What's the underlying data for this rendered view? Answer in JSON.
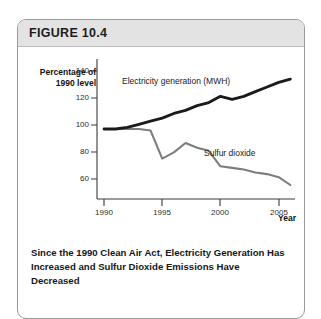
{
  "figure": {
    "header_label": "FIGURE 10.4",
    "caption": "Since the 1990 Clean Air Act, Electricity Generation Has Increased and Sulfur Dioxide Emissions Have Decreased"
  },
  "colors": {
    "electricity_line": "#1a1a1a",
    "sulfur_line": "#7d7d7d",
    "axis": "#3a3a3a",
    "header_band": "#e3e3e3",
    "card_border": "#9a9a9a"
  },
  "chart_data": {
    "type": "line",
    "title": "",
    "xlabel": "Year",
    "ylabel": "Percentage of\n1990 level",
    "xlim": [
      1989.4,
      2006.4
    ],
    "ylim": [
      55,
      145
    ],
    "grid": false,
    "legend": "inline-labels",
    "xticks": [
      1990,
      1995,
      2000,
      2005
    ],
    "yticks": [
      60,
      80,
      100,
      120,
      140
    ],
    "x": [
      1990,
      1991,
      1992,
      1993,
      1994,
      1995,
      1996,
      1997,
      1998,
      1999,
      2000,
      2001,
      2002,
      2003,
      2004,
      2005,
      2006
    ],
    "series": [
      {
        "name": "Electricity generation (MWH)",
        "color": "#1a1a1a",
        "values": [
          100,
          100,
          101,
          103,
          105,
          107,
          110,
          112,
          115,
          117,
          121,
          119,
          121,
          124,
          127,
          130,
          132
        ]
      },
      {
        "name": "Sulfur dioxide",
        "color": "#7d7d7d",
        "values": [
          100,
          100,
          100,
          100,
          99,
          81,
          85,
          91,
          88,
          86,
          76,
          75,
          74,
          72,
          71,
          69,
          64
        ]
      }
    ]
  }
}
